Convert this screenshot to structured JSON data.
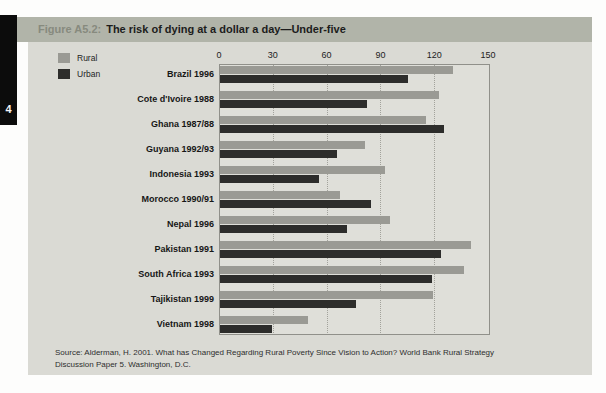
{
  "page": {
    "side_tab_number": "4"
  },
  "figure": {
    "label": "Figure A5.2:",
    "title": "The risk of dying at a dollar a day—Under-five"
  },
  "source": {
    "line1": "Source: Alderman, H. 2001. What has Changed Regarding Rural Poverty Since Vision to Action? World Bank Rural Strategy",
    "line2": "Discussion Paper 5. Washington, D.C."
  },
  "colors": {
    "title_bar": "#b1b4a9",
    "figure_label": "#878a7e",
    "body_background": "#dadad4",
    "plot_background": "#dfdfd9",
    "rural_bar": "#9a9a94",
    "urban_bar": "#2d2d2b",
    "plot_border": "#90908a",
    "side_tab": "#0c0c0c"
  },
  "chart_data": {
    "type": "bar",
    "orientation": "horizontal",
    "title": "The risk of dying at a dollar a day—Under-five",
    "xlabel": "",
    "ylabel": "",
    "xlim": [
      0,
      150
    ],
    "x_ticks": [
      0,
      30,
      60,
      90,
      120,
      150
    ],
    "grid": "dotted vertical gridlines at 30, 60, 90, 120",
    "legend_position": "top-left",
    "categories": [
      "Brazil 1996",
      "Cote d'Ivoire 1988",
      "Ghana 1987/88",
      "Guyana 1992/93",
      "Indonesia 1993",
      "Morocco 1990/91",
      "Nepal 1996",
      "Pakistan 1991",
      "South Africa 1993",
      "Tajikistan 1999",
      "Vietnam 1998"
    ],
    "series": [
      {
        "name": "Rural",
        "color": "#9a9a94",
        "values": [
          130,
          122,
          115,
          81,
          92,
          67,
          95,
          140,
          136,
          119,
          49
        ]
      },
      {
        "name": "Urban",
        "color": "#2d2d2b",
        "values": [
          105,
          82,
          125,
          65,
          55,
          84,
          71,
          123,
          118,
          76,
          29
        ]
      }
    ]
  }
}
